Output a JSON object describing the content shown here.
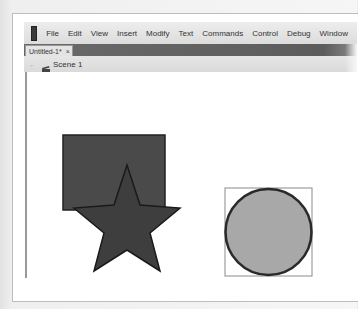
{
  "menubar": {
    "logo": "flash-logo-icon",
    "items": [
      "File",
      "Edit",
      "View",
      "Insert",
      "Modify",
      "Text",
      "Commands",
      "Control",
      "Debug",
      "Window"
    ]
  },
  "document_tab": {
    "label": "Untitled-1*",
    "close": "×"
  },
  "scene_bar": {
    "back": "←",
    "scene_label": "Scene 1"
  },
  "stage": {
    "shapes": [
      {
        "type": "rectangle",
        "fill": "#4a4a4a",
        "stroke": "#222222"
      },
      {
        "type": "star",
        "fill": "#3e3e3e",
        "stroke": "#1a1a1a"
      },
      {
        "type": "circle",
        "fill": "#a8a8a8",
        "stroke": "#2a2a2a",
        "selected": true
      }
    ]
  },
  "colors": {
    "menubar_bg": "#e4e4e4",
    "tabbar_bg": "#636363",
    "stage_bg": "#ffffff"
  }
}
